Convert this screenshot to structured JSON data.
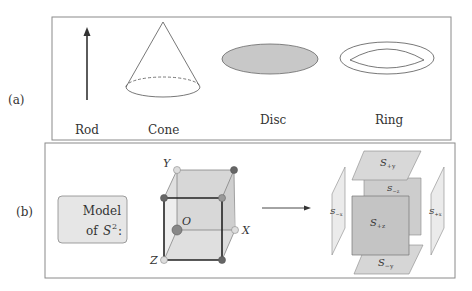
{
  "panels": {
    "a": {
      "tag": "(a)",
      "items": [
        {
          "label": "Rod",
          "shape": "arrow"
        },
        {
          "label": "Cone",
          "shape": "cone"
        },
        {
          "label": "Disc",
          "shape": "filled-ellipse"
        },
        {
          "label": "Ring",
          "shape": "ring"
        }
      ]
    },
    "b": {
      "tag": "(b)",
      "model_box": {
        "line1": "Model",
        "line2_prefix": "of ",
        "line2_symbol": "S",
        "line2_sup": "2",
        "line2_suffix": ":"
      },
      "cube": {
        "axis_labels": {
          "x": "X",
          "y": "Y",
          "z": "Z",
          "origin": "O"
        }
      },
      "exploded_faces": [
        {
          "id": "plus_y",
          "S": "S",
          "sub": "+y"
        },
        {
          "id": "minus_z",
          "S": "S",
          "sub": "−z"
        },
        {
          "id": "minus_x",
          "S": "S",
          "sub": "−x"
        },
        {
          "id": "plus_z",
          "S": "S",
          "sub": "+z"
        },
        {
          "id": "plus_x",
          "S": "S",
          "sub": "+x"
        },
        {
          "id": "minus_y",
          "S": "S",
          "sub": "−y"
        }
      ]
    }
  },
  "colors": {
    "frame": "#8a8a8a",
    "disc_fill": "#c8c8c8",
    "model_box_fill": "#e6e6e6",
    "face_light": "#e4e4e4",
    "face_mid": "#cfcfcf",
    "face_dark": "#bdbdbd",
    "vertex_dark": "#666666",
    "vertex_light": "#dddddd"
  }
}
